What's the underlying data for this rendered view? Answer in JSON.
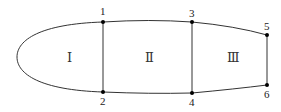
{
  "diagram": {
    "points": [
      {
        "id": "1",
        "label": "1",
        "x": 103,
        "y": 22,
        "label_x": 100,
        "label_y": 15
      },
      {
        "id": "2",
        "label": "2",
        "x": 103,
        "y": 92,
        "label_x": 100,
        "label_y": 105
      },
      {
        "id": "3",
        "label": "3",
        "x": 192,
        "y": 22,
        "label_x": 189,
        "label_y": 17
      },
      {
        "id": "4",
        "label": "4",
        "x": 192,
        "y": 93,
        "label_x": 189,
        "label_y": 106
      },
      {
        "id": "5",
        "label": "5",
        "x": 267,
        "y": 35,
        "label_x": 264,
        "label_y": 30
      },
      {
        "id": "6",
        "label": "6",
        "x": 267,
        "y": 85,
        "label_x": 264,
        "label_y": 98
      }
    ],
    "regions": [
      {
        "id": "I",
        "label": "Ⅰ",
        "x": 70,
        "y": 61
      },
      {
        "id": "II",
        "label": "Ⅱ",
        "x": 149,
        "y": 61
      },
      {
        "id": "III",
        "label": "Ⅲ",
        "x": 232,
        "y": 61
      }
    ],
    "stroke_color": "#333333"
  }
}
